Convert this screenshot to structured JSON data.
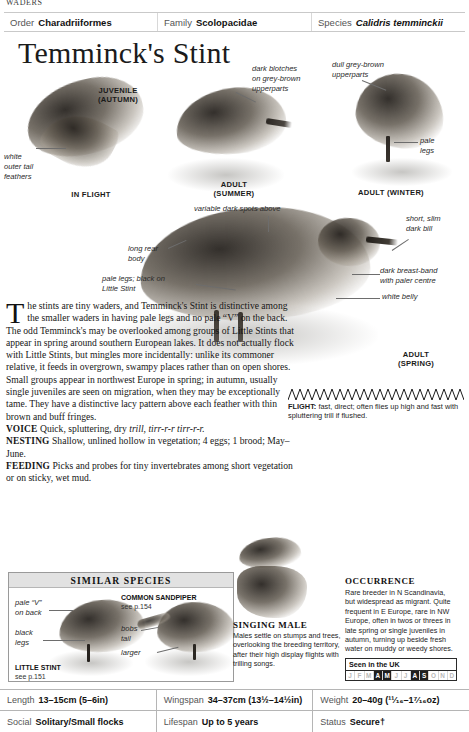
{
  "running_head": "WADERS",
  "taxonomy": [
    {
      "label": "Order",
      "value": "Charadriiformes",
      "italic": false
    },
    {
      "label": "Family",
      "value": "Scolopacidae",
      "italic": false
    },
    {
      "label": "Species",
      "value": "Calidris temminckii",
      "italic": true
    }
  ],
  "title": "Temminck's Stint",
  "plate": {
    "captions": [
      {
        "id": "juvenile-autumn",
        "lines": [
          "JUVENILE",
          "(AUTUMN)"
        ]
      },
      {
        "id": "in-flight",
        "lines": [
          "IN FLIGHT"
        ]
      },
      {
        "id": "adult-summer",
        "lines": [
          "ADULT",
          "(SUMMER)"
        ]
      },
      {
        "id": "adult-winter",
        "lines": [
          "ADULT (WINTER)"
        ]
      },
      {
        "id": "adult-spring",
        "lines": [
          "ADULT",
          "(SPRING)"
        ]
      }
    ],
    "leaders": [
      {
        "id": "white-outer-tail-feathers",
        "text": "white\nouter tail\nfeathers"
      },
      {
        "id": "dark-blotches",
        "text": "dark blotches\non grey-brown\nupperparts"
      },
      {
        "id": "dull-grey-brown",
        "text": "dull grey-brown\nupperparts"
      },
      {
        "id": "pale-legs",
        "text": "pale\nlegs"
      },
      {
        "id": "variable-dark-spots",
        "text": "variable dark spots above"
      },
      {
        "id": "short-slim-dark-bill",
        "text": "short, slim\ndark bill"
      },
      {
        "id": "long-rear-body",
        "text": "long rear\nbody"
      },
      {
        "id": "pale-legs-black-little",
        "text": "pale legs; black on\nLittle Stint"
      },
      {
        "id": "dark-breast-band",
        "text": "dark breast-band\nwith paler centre"
      },
      {
        "id": "white-belly",
        "text": "white belly"
      }
    ]
  },
  "body": {
    "dropcap": "T",
    "intro": "he stints are tiny waders, and Temminck's Stint is distinctive among the smaller waders in having pale legs and no pale “V” on the back. The odd Temminck's may be overlooked among groups of Little Stints that appear in spring around southern European lakes. It does not actually flock with Little Stints, but mingles more incidentally: unlike its commoner relative, it feeds in overgrown, swampy places rather than on open shores. Small groups appear in northwest Europe in spring; in autumn, usually single juveniles are seen on migration, when they may be exceptionally tame. They have a distinctive lacy pattern above each feather with thin brown and buff fringes.",
    "sections": [
      {
        "label": "VOICE",
        "text": "Quick, spluttering, dry ",
        "italic_tail": "trill, tirr-r-r tirr-r-r."
      },
      {
        "label": "NESTING",
        "text": "Shallow, unlined hollow in vegetation; 4 eggs; 1 brood; May–June.",
        "italic_tail": ""
      },
      {
        "label": "FEEDING",
        "text": "Picks and probes for tiny invertebrates among short vegetation or on sticky, wet mud.",
        "italic_tail": ""
      }
    ]
  },
  "flight": {
    "label": "FLIGHT:",
    "text": " fast, direct; often flies up high and fast with spluttering trill if flushed."
  },
  "similar_species": {
    "heading": "SIMILAR SPECIES",
    "entries": [
      {
        "name": "LITTLE STINT",
        "page": "see p.151",
        "leaders": [
          {
            "id": "pale-v-on-back",
            "text": "pale “V”\non back"
          },
          {
            "id": "black-legs",
            "text": "black\nlegs"
          }
        ]
      },
      {
        "name": "COMMON SANDPIPER",
        "page": "see p.154",
        "leaders": [
          {
            "id": "bobs-tail",
            "text": "bobs\ntail"
          },
          {
            "id": "larger",
            "text": "larger"
          }
        ]
      }
    ]
  },
  "singing_male": {
    "title": "SINGING MALE",
    "text": "Males settle on stumps and trees, overlooking the breeding territory, after their high display flights with trilling songs."
  },
  "occurrence": {
    "title": "OCCURRENCE",
    "text": "Rare breeder in N Scandinavia, but widespread as migrant. Quite frequent in E Europe, rare in NW Europe, often in twos or threes in late spring or single juveniles in autumn, turning up beside fresh water on muddy or weedy shores.",
    "uk_box": {
      "title": "Seen in the UK",
      "months": [
        {
          "letter": "J",
          "seen": false
        },
        {
          "letter": "F",
          "seen": false
        },
        {
          "letter": "M",
          "seen": false
        },
        {
          "letter": "A",
          "seen": true
        },
        {
          "letter": "M",
          "seen": true
        },
        {
          "letter": "J",
          "seen": false
        },
        {
          "letter": "J",
          "seen": false
        },
        {
          "letter": "A",
          "seen": true
        },
        {
          "letter": "S",
          "seen": true
        },
        {
          "letter": "O",
          "seen": false
        },
        {
          "letter": "N",
          "seen": false
        },
        {
          "letter": "D",
          "seen": false
        }
      ]
    }
  },
  "stats": [
    [
      {
        "label": "Length",
        "value": "13–15cm (5–6in)"
      },
      {
        "label": "Wingspan",
        "value": "34–37cm (13½–14½in)"
      },
      {
        "label": "Weight",
        "value": "20–40g (¹¹⁄₁₆–1⁷⁄₁₆oz)"
      }
    ],
    [
      {
        "label": "Social",
        "value": "Solitary/Small flocks"
      },
      {
        "label": "Lifespan",
        "value": "Up to 5 years"
      },
      {
        "label": "Status",
        "value": "Secure†"
      }
    ]
  ]
}
